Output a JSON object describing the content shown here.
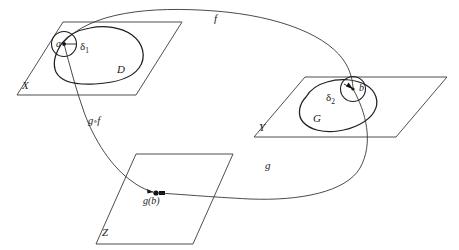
{
  "diagram": {
    "type": "mathematical-diagram",
    "stroke_color": "#262626",
    "background_color": "#ffffff",
    "planes": [
      {
        "id": "X",
        "label": "X",
        "contains_region": "D",
        "contains_point": "a"
      },
      {
        "id": "Y",
        "label": "Y",
        "contains_region": "G",
        "contains_point": "b"
      },
      {
        "id": "Z",
        "label": "Z",
        "contains_point": "g(b)"
      }
    ],
    "regions": [
      {
        "id": "D",
        "label": "D",
        "plane": "X"
      },
      {
        "id": "G",
        "label": "G",
        "plane": "Y"
      }
    ],
    "points": [
      {
        "id": "a",
        "label": "a",
        "plane": "X"
      },
      {
        "id": "b",
        "label": "b",
        "plane": "Y"
      },
      {
        "id": "gb",
        "label": "g(b)",
        "plane": "Z"
      }
    ],
    "neighborhoods": [
      {
        "id": "delta1",
        "label": "δ",
        "subscript": "1",
        "center_point": "a",
        "plane": "X"
      },
      {
        "id": "delta2",
        "label": "δ",
        "subscript": "2",
        "center_point": "b",
        "plane": "Y"
      }
    ],
    "maps": [
      {
        "id": "f",
        "label": "f",
        "from": "X",
        "to": "Y"
      },
      {
        "id": "g",
        "label": "g",
        "from": "Y",
        "to": "Z"
      },
      {
        "id": "gof",
        "label": "g",
        "ring": "∘",
        "label2": "f",
        "from": "X",
        "to": "Z"
      }
    ]
  }
}
